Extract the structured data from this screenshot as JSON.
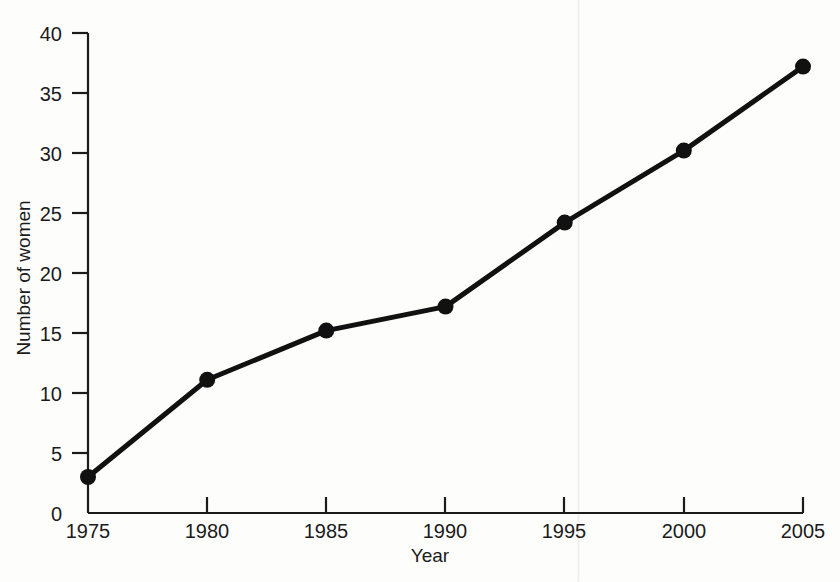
{
  "chart_data": {
    "type": "line",
    "title": "",
    "xlabel": "Year",
    "ylabel": "Number of women",
    "x": [
      1975,
      1980,
      1985,
      1990,
      1995,
      2000,
      2005
    ],
    "values": [
      3.0,
      11.1,
      15.2,
      17.2,
      24.2,
      30.2,
      37.2
    ],
    "series": [
      {
        "name": "Number of women",
        "values": [
          3.0,
          11.1,
          15.2,
          17.2,
          24.2,
          30.2,
          37.2
        ]
      }
    ],
    "xlim": [
      1975,
      2005
    ],
    "ylim": [
      0,
      40
    ],
    "xticks": [
      1975,
      1980,
      1985,
      1990,
      1995,
      2000,
      2005
    ],
    "yticks": [
      0,
      5,
      10,
      15,
      20,
      25,
      30,
      35,
      40
    ],
    "xtick_labels": [
      "1975",
      "1980",
      "1985",
      "1990",
      "1995",
      "2000",
      "2005"
    ],
    "ytick_labels": [
      "0",
      "5",
      "10",
      "15",
      "20",
      "25",
      "30",
      "35",
      "40"
    ],
    "grid": false,
    "legend": false,
    "legend_position": "none",
    "marker": "filled-circle",
    "line_color": "#111111",
    "marker_color": "#111111",
    "axis_color": "#1b1b1b",
    "background_color": "#fdfdfc"
  }
}
